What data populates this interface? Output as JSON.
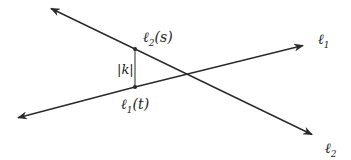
{
  "diagram": {
    "title": "",
    "lines": [
      {
        "id": "l1",
        "label": "ℓ",
        "subscript": "1",
        "from": [
          17,
          118
        ],
        "to": [
          305,
          45
        ]
      },
      {
        "id": "l2",
        "label": "ℓ",
        "subscript": "2",
        "from": [
          50,
          8
        ],
        "to": [
          313,
          135
        ]
      }
    ],
    "points": [
      {
        "label": "ℓ",
        "subscript": "2",
        "arg": "(s)",
        "x": 135,
        "y": 49
      },
      {
        "label": "ℓ",
        "subscript": "1",
        "arg": "(t)",
        "x": 135,
        "y": 87
      }
    ],
    "distance_label": "|k|",
    "stroke_color": "#2a2a2a"
  }
}
